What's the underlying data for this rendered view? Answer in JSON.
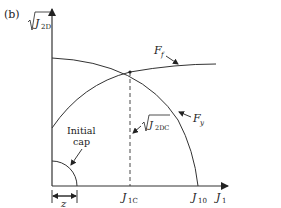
{
  "panel_label": "(b)",
  "axes": {
    "y_label": "J",
    "y_sub": "2D",
    "x_label": "J",
    "x_sub": "1"
  },
  "curves": {
    "ff_label": "F",
    "ff_sub": "f",
    "fy_label": "F",
    "fy_sub": "y"
  },
  "annotations": {
    "cap_line1": "Initial",
    "cap_line2": "cap",
    "j2dc_label": "J",
    "j2dc_sub": "2DC",
    "z_label": "z"
  },
  "ticks": {
    "j1c_main": "J",
    "j1c_sub": "1C",
    "j10_main": "J",
    "j10_sub": "10"
  },
  "colors": {
    "line": "#333333",
    "background": "#ffffff"
  }
}
